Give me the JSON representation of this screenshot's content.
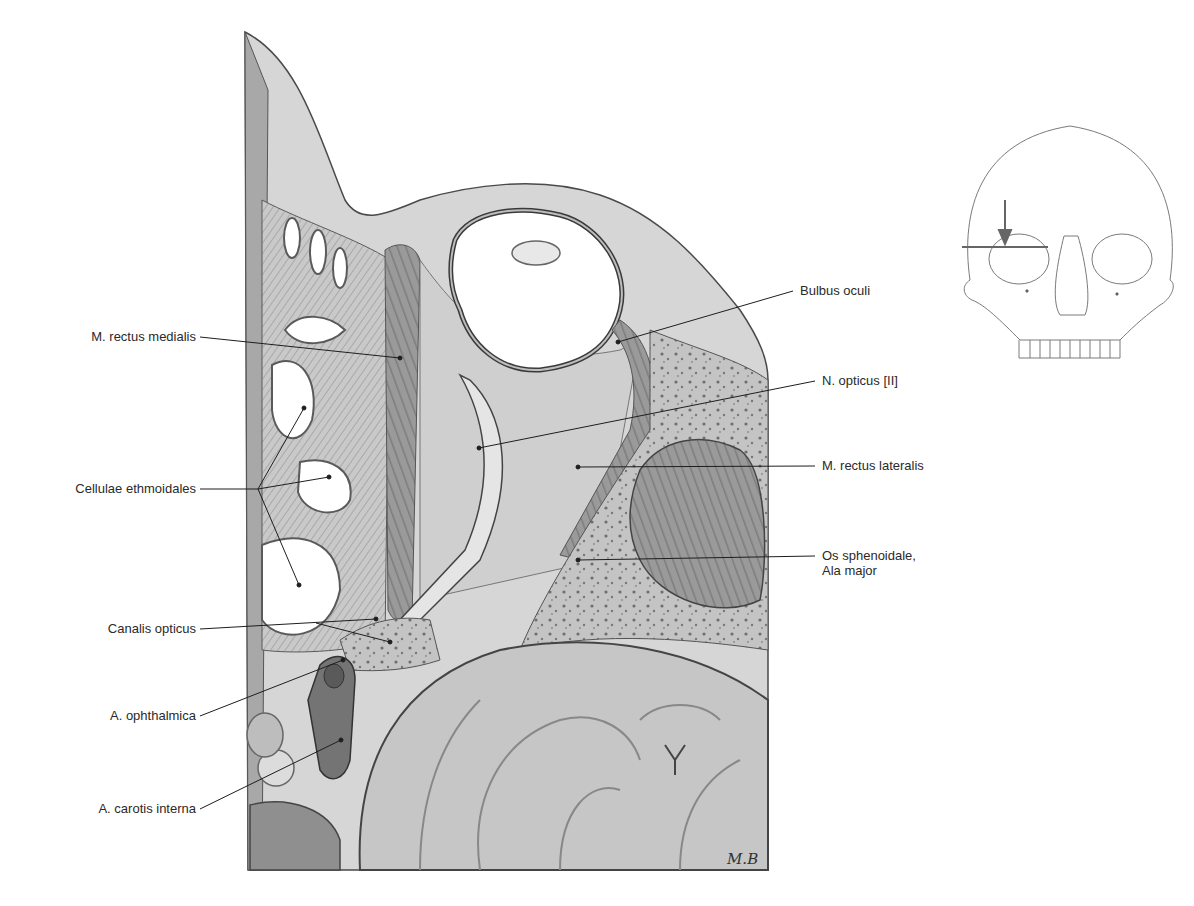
{
  "figure": {
    "signature": "M.B",
    "colors": {
      "ink": "#2a2a2a",
      "leader": "#1e1e1e",
      "tissue_light": "#d9d9d9",
      "tissue_mid": "#b5b5b5",
      "tissue_dark": "#7a7a7a",
      "brain": "#c8c8c8",
      "vessel": "#6e6e6e"
    }
  },
  "labels_left": [
    {
      "id": "m-rectus-medialis",
      "text": "M. rectus medialis"
    },
    {
      "id": "cellulae-ethmoidales",
      "text": "Cellulae ethmoidales"
    },
    {
      "id": "canalis-opticus",
      "text": "Canalis opticus"
    },
    {
      "id": "a-ophthalmica",
      "text": "A. ophthalmica"
    },
    {
      "id": "a-carotis-interna",
      "text": "A. carotis interna"
    }
  ],
  "labels_right": [
    {
      "id": "bulbus-oculi",
      "text": "Bulbus oculi"
    },
    {
      "id": "n-opticus",
      "text": "N. opticus [II]"
    },
    {
      "id": "m-rectus-lateralis",
      "text": "M. rectus lateralis"
    },
    {
      "id": "os-sphenoidale",
      "text": "Os sphenoidale,",
      "text2": "Ala major"
    }
  ],
  "orientation_inset": {
    "description": "Frontal view of skull with horizontal section line through the right orbit and downward arrow",
    "icon": "skull-icon"
  }
}
